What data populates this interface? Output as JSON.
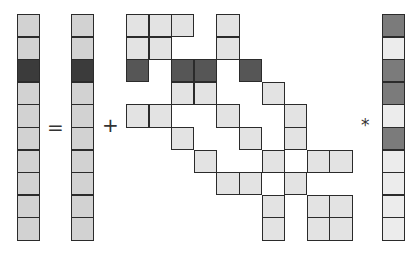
{
  "diagram": {
    "cell_size": 22.6,
    "top": 14,
    "colors": {
      "vector_light": "#d2d2d2",
      "vector_dark": "#3b3b3b",
      "matrix_light": "#e3e3e3",
      "matrix_dark": "#565656",
      "x_light": "#ececec",
      "x_dark": "#7b7b7b",
      "border": "#2b2b2b"
    },
    "operators": {
      "equals": "=",
      "plus": "+",
      "times": "*"
    },
    "vector_y_out": {
      "left": 17,
      "cells": [
        "light",
        "light",
        "dark",
        "light",
        "light",
        "light",
        "light",
        "light",
        "light",
        "light"
      ]
    },
    "vector_y_in": {
      "left": 71,
      "cells": [
        "light",
        "light",
        "dark",
        "light",
        "light",
        "light",
        "light",
        "light",
        "light",
        "light"
      ]
    },
    "matrix_A": {
      "left": 126,
      "rows": 10,
      "cols": 10,
      "nonzeros": [
        {
          "r": 0,
          "c": 0,
          "v": "light"
        },
        {
          "r": 0,
          "c": 1,
          "v": "light"
        },
        {
          "r": 0,
          "c": 2,
          "v": "light"
        },
        {
          "r": 0,
          "c": 4,
          "v": "light"
        },
        {
          "r": 1,
          "c": 0,
          "v": "light"
        },
        {
          "r": 1,
          "c": 1,
          "v": "light"
        },
        {
          "r": 1,
          "c": 4,
          "v": "light"
        },
        {
          "r": 2,
          "c": 0,
          "v": "dark"
        },
        {
          "r": 2,
          "c": 2,
          "v": "dark"
        },
        {
          "r": 2,
          "c": 3,
          "v": "dark"
        },
        {
          "r": 2,
          "c": 5,
          "v": "dark"
        },
        {
          "r": 3,
          "c": 2,
          "v": "light"
        },
        {
          "r": 3,
          "c": 3,
          "v": "light"
        },
        {
          "r": 3,
          "c": 6,
          "v": "light"
        },
        {
          "r": 4,
          "c": 0,
          "v": "light"
        },
        {
          "r": 4,
          "c": 1,
          "v": "light"
        },
        {
          "r": 4,
          "c": 4,
          "v": "light"
        },
        {
          "r": 4,
          "c": 7,
          "v": "light"
        },
        {
          "r": 5,
          "c": 2,
          "v": "light"
        },
        {
          "r": 5,
          "c": 5,
          "v": "light"
        },
        {
          "r": 5,
          "c": 7,
          "v": "light"
        },
        {
          "r": 6,
          "c": 3,
          "v": "light"
        },
        {
          "r": 6,
          "c": 6,
          "v": "light"
        },
        {
          "r": 6,
          "c": 8,
          "v": "light"
        },
        {
          "r": 6,
          "c": 9,
          "v": "light"
        },
        {
          "r": 7,
          "c": 4,
          "v": "light"
        },
        {
          "r": 7,
          "c": 5,
          "v": "light"
        },
        {
          "r": 7,
          "c": 7,
          "v": "light"
        },
        {
          "r": 8,
          "c": 6,
          "v": "light"
        },
        {
          "r": 8,
          "c": 8,
          "v": "light"
        },
        {
          "r": 8,
          "c": 9,
          "v": "light"
        },
        {
          "r": 9,
          "c": 6,
          "v": "light"
        },
        {
          "r": 9,
          "c": 8,
          "v": "light"
        },
        {
          "r": 9,
          "c": 9,
          "v": "light"
        }
      ]
    },
    "vector_x": {
      "left": 382,
      "cells": [
        "dark",
        "light",
        "dark",
        "dark",
        "light",
        "dark",
        "light",
        "light",
        "light",
        "light"
      ]
    }
  }
}
